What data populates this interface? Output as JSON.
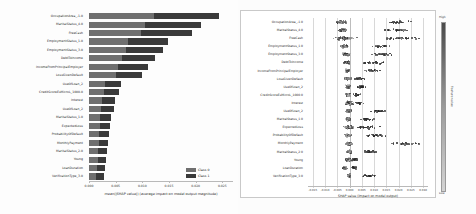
{
  "chart_data": [
    {
      "type": "bar",
      "orientation": "horizontal",
      "stacked": true,
      "title": "",
      "xlabel": "mean(|SHAP value|) (average impact on model output magnitude)",
      "ylabel": "",
      "xlim": [
        0,
        0.027
      ],
      "xticks": [
        "0.000",
        "0.005",
        "0.010",
        "0.015",
        "0.020",
        "0.025"
      ],
      "xtick_values": [
        0.0,
        0.005,
        0.01,
        0.015,
        0.02,
        0.025
      ],
      "grid": false,
      "legend_position": "lower right",
      "legend": [
        "Class 0",
        "Class 1"
      ],
      "colors": [
        "#6f6f6f",
        "#3a3a3a"
      ],
      "categories": [
        "OccupationArea_-1.0",
        "MaritalStatus_4.0",
        "FreeCash",
        "EmploymentStatus_1.0",
        "EmploymentStatus_3.0",
        "DebtToIncome",
        "IncomeFromPrincipalEmployer",
        "LossGivenDefault",
        "UseOfLoan_2",
        "CreditScoreEsMicroL_1000.0",
        "Interest",
        "UseOfLoan_2",
        "MaritalStatus_1.0",
        "ExpectedLoss",
        "ProbabilityOfDefault",
        "MonthlyPayment",
        "MaritalStatus_2.0",
        "Young",
        "LoanDuration",
        "VerificationType_3.0"
      ],
      "series": [
        {
          "name": "Class 0",
          "values": [
            0.0122,
            0.0105,
            0.0097,
            0.0074,
            0.0069,
            0.0062,
            0.0055,
            0.005,
            0.003,
            0.0028,
            0.0024,
            0.0023,
            0.0021,
            0.002,
            0.0019,
            0.0018,
            0.0017,
            0.0016,
            0.0015,
            0.0014
          ]
        },
        {
          "name": "Class 1",
          "values": [
            0.0122,
            0.0105,
            0.0097,
            0.0074,
            0.0069,
            0.0062,
            0.0055,
            0.005,
            0.003,
            0.0028,
            0.0024,
            0.0023,
            0.0021,
            0.002,
            0.0019,
            0.0018,
            0.0017,
            0.0016,
            0.0015,
            0.0014
          ]
        }
      ],
      "totals": [
        0.0244,
        0.021,
        0.0194,
        0.0148,
        0.0138,
        0.0124,
        0.011,
        0.01,
        0.006,
        0.0056,
        0.0048,
        0.0046,
        0.0042,
        0.004,
        0.0038,
        0.0036,
        0.0034,
        0.0032,
        0.003,
        0.0028
      ]
    },
    {
      "type": "scatter",
      "variant": "beeswarm",
      "title": "",
      "xlabel": "SHAP value (impact on model output)",
      "ylabel": "",
      "xlim": [
        -0.017,
        0.032
      ],
      "xticks": [
        "-0.015",
        "-0.010",
        "-0.005",
        "0.000",
        "0.005",
        "0.010",
        "0.015",
        "0.020",
        "0.025",
        "0.030"
      ],
      "xtick_values": [
        -0.015,
        -0.01,
        -0.005,
        0.0,
        0.005,
        0.01,
        0.015,
        0.02,
        0.025,
        0.03
      ],
      "grid": true,
      "colorbar": {
        "title": "Feature value",
        "high_label": "High",
        "low_label": "Low",
        "high_color": "#4a4a4a",
        "low_color": "#d4d4d4"
      },
      "categories": [
        "OccupationArea_-1.0",
        "MaritalStatus_4.0",
        "FreeCash",
        "EmploymentStatus_1.0",
        "EmploymentStatus_3.0",
        "DebtToIncome",
        "IncomeFromPrincipalEmployer",
        "LossGivenDefault",
        "UseOfLoan_2",
        "CreditScoreEsMicroL_1000.0",
        "Interest",
        "UseOfLoan_2",
        "MaritalStatus_1.0",
        "ExpectedLoss",
        "ProbabilityOfDefault",
        "MonthlyPayment",
        "MaritalStatus_2.0",
        "Young",
        "LoanDuration",
        "VerificationType_3.0"
      ],
      "rows": [
        {
          "feature": "OccupationArea_-1.0",
          "cluster_center": -0.0035,
          "cluster_spread": 0.0016,
          "tail_center": 0.0195,
          "tail_spread": 0.0045
        },
        {
          "feature": "MaritalStatus_4.0",
          "cluster_center": -0.0028,
          "cluster_spread": 0.0018,
          "tail_center": 0.02,
          "tail_spread": 0.0048
        },
        {
          "feature": "FreeCash",
          "cluster_center": -0.002,
          "cluster_spread": 0.0038,
          "tail_center": 0.0215,
          "tail_spread": 0.007
        },
        {
          "feature": "EmploymentStatus_1.0",
          "cluster_center": -0.0022,
          "cluster_spread": 0.0014,
          "tail_center": 0.013,
          "tail_spread": 0.0035
        },
        {
          "feature": "EmploymentStatus_3.0",
          "cluster_center": -0.0016,
          "cluster_spread": 0.0012,
          "tail_center": 0.0125,
          "tail_spread": 0.0042
        },
        {
          "feature": "DebtToIncome",
          "cluster_center": -0.0012,
          "cluster_spread": 0.0011,
          "tail_center": 0.0105,
          "tail_spread": 0.004
        },
        {
          "feature": "IncomeFromPrincipalEmployer",
          "cluster_center": -0.001,
          "cluster_spread": 0.001,
          "tail_center": 0.009,
          "tail_spread": 0.003
        },
        {
          "feature": "LossGivenDefault",
          "cluster_center": -0.0008,
          "cluster_spread": 0.0014,
          "tail_center": 0.0042,
          "tail_spread": 0.002
        },
        {
          "feature": "UseOfLoan_2",
          "cluster_center": -0.0006,
          "cluster_spread": 0.0009,
          "tail_center": 0.0048,
          "tail_spread": 0.0018
        },
        {
          "feature": "CreditScoreEsMicroL_1000.0",
          "cluster_center": -0.0005,
          "cluster_spread": 0.0008,
          "tail_center": 0.003,
          "tail_spread": 0.0014
        },
        {
          "feature": "Interest",
          "cluster_center": -0.0004,
          "cluster_spread": 0.0016,
          "tail_center": 0.0038,
          "tail_spread": 0.0016
        },
        {
          "feature": "UseOfLoan_2",
          "cluster_center": -0.0004,
          "cluster_spread": 0.001,
          "tail_center": 0.0115,
          "tail_spread": 0.0032
        },
        {
          "feature": "MaritalStatus_1.0",
          "cluster_center": -0.0004,
          "cluster_spread": 0.0009,
          "tail_center": 0.0075,
          "tail_spread": 0.003
        },
        {
          "feature": "ExpectedLoss",
          "cluster_center": -0.0003,
          "cluster_spread": 0.0018,
          "tail_center": 0.007,
          "tail_spread": 0.004
        },
        {
          "feature": "ProbabilityOfDefault",
          "cluster_center": -0.0003,
          "cluster_spread": 0.0016,
          "tail_center": 0.0105,
          "tail_spread": 0.004
        },
        {
          "feature": "MonthlyPayment",
          "cluster_center": -0.0002,
          "cluster_spread": 0.0012,
          "tail_center": 0.023,
          "tail_spread": 0.006
        },
        {
          "feature": "MaritalStatus_2.0",
          "cluster_center": -0.0002,
          "cluster_spread": 0.0009,
          "tail_center": 0.0085,
          "tail_spread": 0.0028
        },
        {
          "feature": "Young",
          "cluster_center": -0.0002,
          "cluster_spread": 0.0011,
          "tail_center": 0.0022,
          "tail_spread": 0.0012
        },
        {
          "feature": "LoanDuration",
          "cluster_center": -0.002,
          "cluster_spread": 0.0008,
          "tail_center": 0.002,
          "tail_spread": 0.0014
        },
        {
          "feature": "VerificationType_3.0",
          "cluster_center": -0.0002,
          "cluster_spread": 0.0006,
          "tail_center": 0.008,
          "tail_spread": 0.0026
        }
      ]
    }
  ],
  "left_panel": {
    "legend": [
      {
        "label": "Class 0",
        "color": "#6f6f6f"
      },
      {
        "label": "Class 1",
        "color": "#3a3a3a"
      }
    ],
    "xlabel": "mean(|SHAP value|) (average impact on model output magnitude)"
  },
  "right_panel": {
    "xlabel": "SHAP value (impact on model output)",
    "colorbar_title": "Feature value",
    "colorbar_high": "High",
    "colorbar_low": "Low"
  }
}
